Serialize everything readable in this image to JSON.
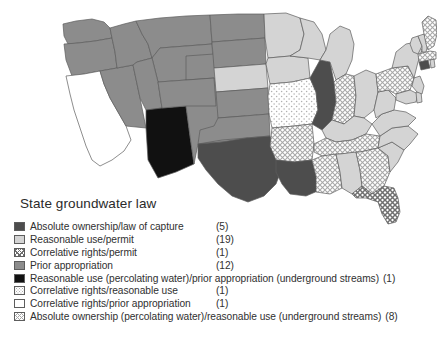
{
  "title": "State groundwater law",
  "colors": {
    "absolute_ownership": "#4d4d4d",
    "reasonable_use_permit": "#d4d4d4",
    "prior_appropriation": "#8c8c8c",
    "black": "#111111",
    "white": "#ffffff",
    "outline": "#5d5d5d",
    "hatch_dark": "#6f6f6f",
    "hatch_light": "#9a9a9a",
    "dot_light": "#b5b5b5"
  },
  "legend": {
    "items": [
      {
        "label": "Absolute ownership/law of capture",
        "count": "(5)",
        "pattern": "solid-dark-gray",
        "layout": "aligned"
      },
      {
        "label": "Reasonable use/permit",
        "count": "(19)",
        "pattern": "solid-light-gray",
        "layout": "aligned"
      },
      {
        "label": "Correlative rights/permit",
        "count": "(1)",
        "pattern": "crosshatch-dark",
        "layout": "aligned"
      },
      {
        "label": "Prior appropriation",
        "count": "(12)",
        "pattern": "solid-medium-gray",
        "layout": "aligned"
      },
      {
        "label": "Reasonable use (percolating water)/prior appropriation (underground streams)",
        "count": "(1)",
        "pattern": "solid-black",
        "layout": "inline"
      },
      {
        "label": "Correlative rights/reasonable use",
        "count": "(1)",
        "pattern": "dots-sparse",
        "layout": "aligned"
      },
      {
        "label": "Correlative rights/prior appropriation",
        "count": "(1)",
        "pattern": "solid-white",
        "layout": "aligned"
      },
      {
        "label": "Absolute ownership (percolating water)/reasonable use (underground streams)",
        "count": "(8)",
        "pattern": "crosshatch-light",
        "layout": "inline"
      }
    ]
  },
  "map": {
    "description": "Choropleth map of the contiguous United States classifying each state by its groundwater law doctrine.",
    "states": [
      {
        "code": "WA",
        "name": "Washington",
        "category": "prior_appropriation"
      },
      {
        "code": "OR",
        "name": "Oregon",
        "category": "prior_appropriation"
      },
      {
        "code": "CA",
        "name": "California",
        "category": "correlative_rights_prior_appropriation"
      },
      {
        "code": "NV",
        "name": "Nevada",
        "category": "prior_appropriation"
      },
      {
        "code": "ID",
        "name": "Idaho",
        "category": "prior_appropriation"
      },
      {
        "code": "MT",
        "name": "Montana",
        "category": "prior_appropriation"
      },
      {
        "code": "WY",
        "name": "Wyoming",
        "category": "prior_appropriation"
      },
      {
        "code": "UT",
        "name": "Utah",
        "category": "prior_appropriation"
      },
      {
        "code": "AZ",
        "name": "Arizona",
        "category": "reasonable_use_prior_appropriation"
      },
      {
        "code": "NM",
        "name": "New Mexico",
        "category": "prior_appropriation"
      },
      {
        "code": "CO",
        "name": "Colorado",
        "category": "prior_appropriation"
      },
      {
        "code": "ND",
        "name": "North Dakota",
        "category": "prior_appropriation"
      },
      {
        "code": "SD",
        "name": "South Dakota",
        "category": "prior_appropriation"
      },
      {
        "code": "NE",
        "name": "Nebraska",
        "category": "reasonable_use_permit"
      },
      {
        "code": "KS",
        "name": "Kansas",
        "category": "prior_appropriation"
      },
      {
        "code": "OK",
        "name": "Oklahoma",
        "category": "prior_appropriation"
      },
      {
        "code": "TX",
        "name": "Texas",
        "category": "absolute_ownership"
      },
      {
        "code": "MN",
        "name": "Minnesota",
        "category": "reasonable_use_permit"
      },
      {
        "code": "IA",
        "name": "Iowa",
        "category": "reasonable_use_permit"
      },
      {
        "code": "MO",
        "name": "Missouri",
        "category": "correlative_rights_reasonable_use"
      },
      {
        "code": "AR",
        "name": "Arkansas",
        "category": "absolute_ownership_reasonable_use"
      },
      {
        "code": "LA",
        "name": "Louisiana",
        "category": "absolute_ownership"
      },
      {
        "code": "WI",
        "name": "Wisconsin",
        "category": "reasonable_use_permit"
      },
      {
        "code": "IL",
        "name": "Illinois",
        "category": "absolute_ownership"
      },
      {
        "code": "MI",
        "name": "Michigan",
        "category": "reasonable_use_permit"
      },
      {
        "code": "IN",
        "name": "Indiana",
        "category": "absolute_ownership_reasonable_use"
      },
      {
        "code": "OH",
        "name": "Ohio",
        "category": "reasonable_use_permit"
      },
      {
        "code": "KY",
        "name": "Kentucky",
        "category": "reasonable_use_permit"
      },
      {
        "code": "TN",
        "name": "Tennessee",
        "category": "absolute_ownership_reasonable_use"
      },
      {
        "code": "MS",
        "name": "Mississippi",
        "category": "absolute_ownership_reasonable_use"
      },
      {
        "code": "AL",
        "name": "Alabama",
        "category": "reasonable_use_permit"
      },
      {
        "code": "GA",
        "name": "Georgia",
        "category": "absolute_ownership_reasonable_use"
      },
      {
        "code": "FL",
        "name": "Florida",
        "category": "correlative_rights_permit"
      },
      {
        "code": "SC",
        "name": "South Carolina",
        "category": "reasonable_use_permit"
      },
      {
        "code": "NC",
        "name": "North Carolina",
        "category": "reasonable_use_permit"
      },
      {
        "code": "VA",
        "name": "Virginia",
        "category": "reasonable_use_permit"
      },
      {
        "code": "WV",
        "name": "West Virginia",
        "category": "reasonable_use_permit"
      },
      {
        "code": "PA",
        "name": "Pennsylvania",
        "category": "absolute_ownership_reasonable_use"
      },
      {
        "code": "NY",
        "name": "New York",
        "category": "reasonable_use_permit"
      },
      {
        "code": "MD",
        "name": "Maryland",
        "category": "reasonable_use_permit"
      },
      {
        "code": "DE",
        "name": "Delaware",
        "category": "reasonable_use_permit"
      },
      {
        "code": "NJ",
        "name": "New Jersey",
        "category": "reasonable_use_permit"
      },
      {
        "code": "CT",
        "name": "Connecticut",
        "category": "absolute_ownership"
      },
      {
        "code": "RI",
        "name": "Rhode Island",
        "category": "reasonable_use_permit"
      },
      {
        "code": "MA",
        "name": "Massachusetts",
        "category": "absolute_ownership_reasonable_use"
      },
      {
        "code": "VT",
        "name": "Vermont",
        "category": "reasonable_use_permit"
      },
      {
        "code": "NH",
        "name": "New Hampshire",
        "category": "reasonable_use_permit"
      },
      {
        "code": "ME",
        "name": "Maine",
        "category": "absolute_ownership_reasonable_use"
      }
    ]
  }
}
